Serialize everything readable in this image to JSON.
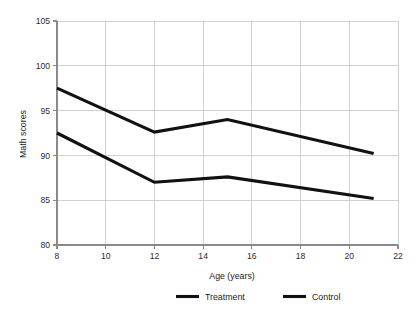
{
  "chart_data": {
    "type": "line",
    "title": "",
    "xlabel": "Age (years)",
    "ylabel": "Math scores",
    "xlim": [
      8,
      22
    ],
    "ylim": [
      80,
      105
    ],
    "xticks": [
      8,
      10,
      12,
      14,
      16,
      18,
      20,
      22
    ],
    "xtick_labels": [
      "8",
      "10",
      "12",
      "14",
      "16",
      "18",
      "20",
      "22"
    ],
    "yticks": [
      80,
      85,
      90,
      95,
      100,
      105
    ],
    "ytick_labels": [
      "80",
      "85",
      "90",
      "95",
      "100",
      "105"
    ],
    "grid": "both",
    "legend_position": "bottom-center",
    "x": [
      8,
      12,
      15,
      21
    ],
    "series": [
      {
        "name": "Treatment",
        "values": [
          97.5,
          92.6,
          94.0,
          90.2
        ],
        "color": "#111111"
      },
      {
        "name": "Control",
        "values": [
          92.5,
          87.0,
          87.6,
          85.2
        ],
        "color": "#111111"
      }
    ]
  },
  "legend": {
    "items": [
      {
        "label": "Treatment"
      },
      {
        "label": "Control"
      }
    ]
  },
  "axes": {
    "x_title": "Age (years)",
    "y_title": "Math scores"
  }
}
